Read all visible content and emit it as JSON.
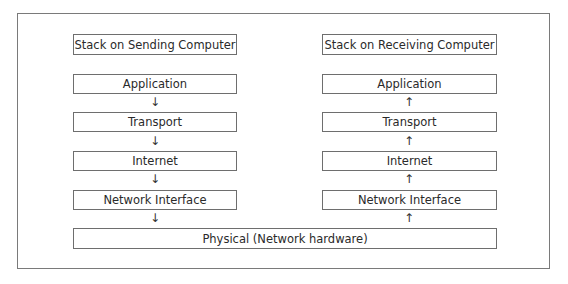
{
  "diagram": {
    "type": "network-stack",
    "sending": {
      "title": "Stack on Sending Computer",
      "layers": [
        "Application",
        "Transport",
        "Internet",
        "Network Interface"
      ],
      "arrow": "↓"
    },
    "receiving": {
      "title": "Stack on Receiving Computer",
      "layers": [
        "Application",
        "Transport",
        "Internet",
        "Network Interface"
      ],
      "arrow": "↑"
    },
    "shared_layer": "Physical (Network hardware)"
  }
}
